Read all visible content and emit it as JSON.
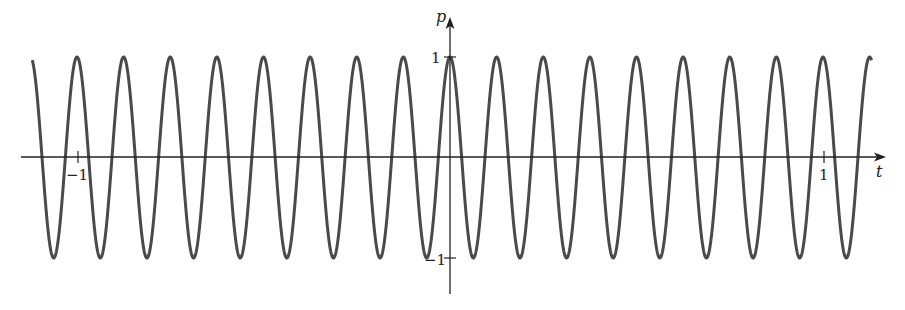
{
  "chart_data": {
    "type": "line",
    "title": "",
    "xlabel": "t",
    "ylabel": "p",
    "function": "p = cos(16πt)",
    "frequency": 8,
    "period": 0.125,
    "amplitude": 1,
    "x_range": [
      -1.12,
      1.13
    ],
    "xlim": [
      -1.15,
      1.16
    ],
    "ylim": [
      -1.35,
      1.35
    ],
    "x_ticks": [
      {
        "value": -1,
        "label": "−1"
      },
      {
        "value": 1,
        "label": "1"
      }
    ],
    "y_ticks": [
      {
        "value": 1,
        "label": "1"
      },
      {
        "value": -1,
        "label": "−1"
      }
    ],
    "grid": false,
    "legend": null,
    "series": [
      {
        "name": "p(t)",
        "color": "#4a4a4a"
      }
    ]
  },
  "axes": {
    "x_label": "t",
    "y_label": "p",
    "x_tick_neg": "−1",
    "x_tick_pos": "1",
    "y_tick_pos": "1",
    "y_tick_neg": "−1",
    "axis_color": "#222222",
    "curve_color": "#4a4a4a"
  }
}
